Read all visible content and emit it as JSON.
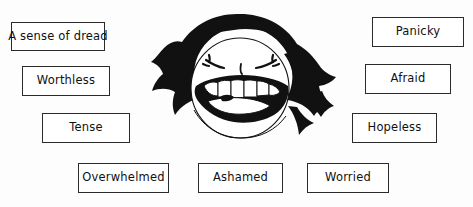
{
  "diagram": {
    "background_color": "#fdfdfd",
    "ink_color": "#111111",
    "box_border_color": "#2b2b2b",
    "box_fill_color": "#ffffff"
  },
  "illustration": {
    "name": "screaming-distressed-face",
    "description": "Cartoon head with black spiky hair, eyes squeezed shut, wide open screaming mouth showing teeth",
    "fill_color": "#111111",
    "skin_color": "#ffffff"
  },
  "labels": [
    {
      "id": "dread",
      "text": "A sense of dread",
      "x": 11,
      "y": 22,
      "w": 94,
      "h": 29
    },
    {
      "id": "worthless",
      "text": "Worthless",
      "x": 22,
      "y": 66,
      "w": 88,
      "h": 30
    },
    {
      "id": "tense",
      "text": "Tense",
      "x": 42,
      "y": 113,
      "w": 88,
      "h": 30
    },
    {
      "id": "overwhelmed",
      "text": "Overwhelmed",
      "x": 78,
      "y": 163,
      "w": 91,
      "h": 30
    },
    {
      "id": "ashamed",
      "text": "Ashamed",
      "x": 198,
      "y": 163,
      "w": 85,
      "h": 30
    },
    {
      "id": "worried",
      "text": "Worried",
      "x": 307,
      "y": 163,
      "w": 82,
      "h": 30
    },
    {
      "id": "panicky",
      "text": "Panicky",
      "x": 372,
      "y": 17,
      "w": 92,
      "h": 30
    },
    {
      "id": "afraid",
      "text": "Afraid",
      "x": 365,
      "y": 64,
      "w": 86,
      "h": 30
    },
    {
      "id": "hopeless",
      "text": "Hopeless",
      "x": 352,
      "y": 113,
      "w": 85,
      "h": 30
    }
  ]
}
